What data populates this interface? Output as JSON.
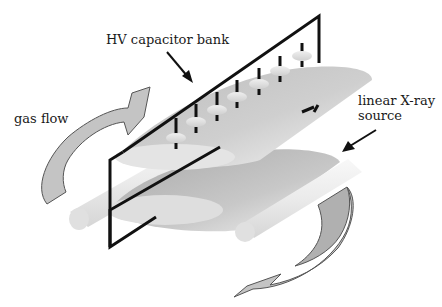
{
  "diagram": {
    "labels": {
      "hv_capacitor_bank": "HV capacitor bank",
      "gas_flow": "gas flow",
      "xray_line1": "linear X-ray",
      "xray_line2": "source"
    },
    "components": {
      "capacitor_count": 7,
      "electrodes": 2,
      "rods": 2,
      "flow_arrows": 2
    },
    "colors": {
      "frame": "#111111",
      "electrode_light": "#e6e6e6",
      "electrode_dark": "#a8a8a8",
      "arrow_fill": "#c4c4c4",
      "arrow_stroke": "#555555",
      "rod": "#eeeeee",
      "capacitor": "#e2e2e2"
    }
  }
}
